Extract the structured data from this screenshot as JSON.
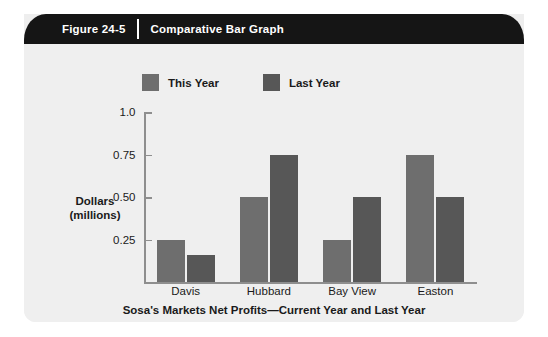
{
  "figure": {
    "number_label": "Figure 24-5",
    "title": "Comparative Bar Graph"
  },
  "colors": {
    "banner_bg": "#151515",
    "panel_bg": "#efefef",
    "this_year": "#6e6e6e",
    "last_year": "#575757",
    "axis": "#8e8e8e",
    "text": "#1a1a1a"
  },
  "chart_data": {
    "type": "bar",
    "title": "",
    "subtitle": "Sosa's Markets Net Profits—Current Year and Last Year",
    "xlabel": "",
    "ylabel": "Dollars (millions)",
    "ylabel_line1": "Dollars",
    "ylabel_line2": "(millions)",
    "categories": [
      "Davis",
      "Hubbard",
      "Bay View",
      "Easton"
    ],
    "series": [
      {
        "name": "This Year",
        "color": "#6e6e6e",
        "values": [
          0.25,
          0.5,
          0.25,
          0.75
        ]
      },
      {
        "name": "Last Year",
        "color": "#575757",
        "values": [
          0.16,
          0.75,
          0.5,
          0.5
        ]
      }
    ],
    "ylim": [
      0,
      1.0
    ],
    "yticks": [
      0.25,
      0.5,
      0.75,
      1.0
    ],
    "ytick_labels": [
      "0.25",
      "0.50",
      "0.75",
      "1.0"
    ],
    "grid": false,
    "legend_position": "top"
  }
}
